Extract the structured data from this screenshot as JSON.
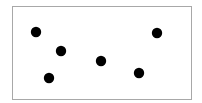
{
  "diagram": {
    "type": "dot-field",
    "frame": {
      "stroke_color": "#a8a8a8",
      "fill_color": "#ffffff"
    },
    "dot_color": "#000000",
    "dot_count": 6,
    "dots": [
      {
        "id": "dot-1",
        "label": "dot"
      },
      {
        "id": "dot-2",
        "label": "dot"
      },
      {
        "id": "dot-3",
        "label": "dot"
      },
      {
        "id": "dot-4",
        "label": "dot"
      },
      {
        "id": "dot-5",
        "label": "dot"
      },
      {
        "id": "dot-6",
        "label": "dot"
      }
    ]
  }
}
